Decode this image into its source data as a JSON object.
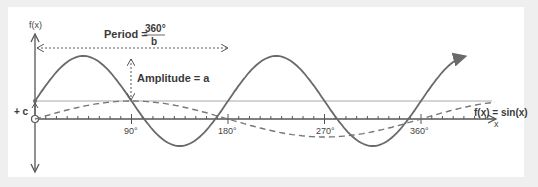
{
  "diagram": {
    "y_axis_label": "f(x)",
    "x_axis_label": "x",
    "offset_label": "+ c",
    "period": {
      "label": "Period =",
      "numerator": "360°",
      "denominator": "b"
    },
    "amplitude_label": "Amplitude = a",
    "reference_curve_label": "f(x) = sin(x)",
    "tick_labels": [
      "90°",
      "180°",
      "270°",
      "360°"
    ],
    "colors": {
      "curve": "#6a6a6a",
      "axis": "#555555",
      "midline": "#aaaaaa",
      "background": "#efefef",
      "panel": "#ffffff"
    }
  }
}
